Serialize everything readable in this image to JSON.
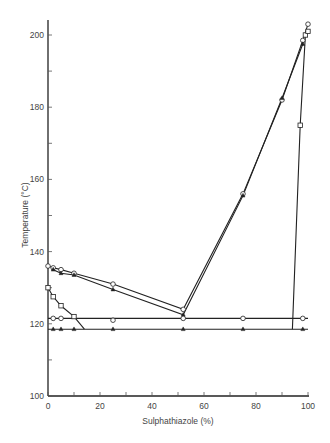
{
  "chart_data": {
    "type": "line",
    "title": "",
    "xlabel": "Sulphathiazole (%)",
    "ylabel": "Temperature (°C)",
    "xlim": [
      0,
      100
    ],
    "ylim": [
      100,
      205
    ],
    "x_ticks": [
      0,
      20,
      40,
      60,
      80,
      100
    ],
    "x_minor_ticks": [
      10,
      30,
      50,
      70,
      90
    ],
    "y_ticks": [
      100,
      120,
      140,
      160,
      180,
      200
    ],
    "y_minor_ticks": [
      110,
      130,
      150,
      170,
      190
    ],
    "grid": false,
    "legend": null,
    "series": [
      {
        "name": "liquidus-circles",
        "marker": "circle",
        "x": [
          0,
          2,
          5,
          10,
          25,
          52,
          75,
          90,
          98,
          100
        ],
        "y": [
          136,
          135.5,
          135,
          134,
          131,
          124,
          156,
          182,
          198.5,
          203
        ]
      },
      {
        "name": "liquidus-triangles",
        "marker": "triangle",
        "x": [
          2,
          5,
          10,
          25,
          52,
          75,
          90,
          98
        ],
        "y": [
          135,
          134,
          133.5,
          129.5,
          122.5,
          155.5,
          182.5,
          197.5
        ]
      },
      {
        "name": "squares-left-branch",
        "marker": "square",
        "x": [
          0,
          2,
          5,
          10,
          14
        ],
        "y": [
          130,
          127.5,
          125,
          122,
          118.5
        ]
      },
      {
        "name": "squares-right-branch",
        "marker": "square",
        "x": [
          94,
          97,
          99,
          100
        ],
        "y": [
          118.5,
          175,
          200,
          201
        ]
      },
      {
        "name": "eutectic-circles",
        "marker": "circle",
        "x": [
          2,
          5,
          25,
          52,
          75,
          98
        ],
        "y": [
          121.5,
          121.5,
          121,
          121.5,
          121.5,
          121.5
        ]
      },
      {
        "name": "solidus-triangles",
        "marker": "triangle",
        "x": [
          2,
          5,
          10,
          25,
          52,
          75,
          98
        ],
        "y": [
          118.5,
          118.5,
          118.5,
          118.5,
          118.5,
          118.5,
          118.5
        ]
      }
    ],
    "reference_lines": [
      {
        "orientation": "horizontal",
        "y": 121.5,
        "x_range": [
          0,
          100
        ]
      },
      {
        "orientation": "horizontal",
        "y": 118.5,
        "x_range": [
          0,
          100
        ]
      }
    ]
  },
  "labels": {
    "xlabel": "Sulphathiazole (%)",
    "ylabel": "Temperature (°C)",
    "x_ticks": [
      "0",
      "20",
      "40",
      "60",
      "80",
      "100"
    ],
    "y_ticks": [
      "100",
      "120",
      "140",
      "160",
      "180",
      "200"
    ]
  }
}
